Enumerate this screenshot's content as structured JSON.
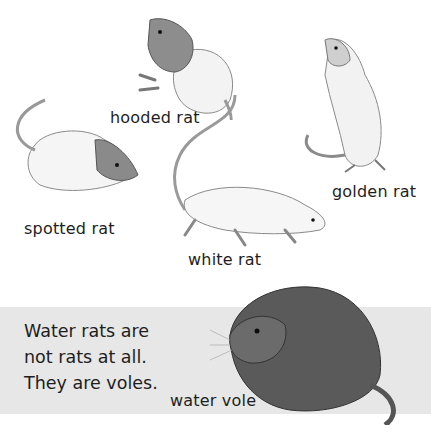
{
  "labels": {
    "hooded_rat": "hooded rat",
    "golden_rat": "golden rat",
    "spotted_rat": "spotted rat",
    "white_rat": "white rat",
    "water_vole": "water vole"
  },
  "caption": {
    "lines": [
      "Water rats are",
      "not rats at all.",
      "They are voles."
    ]
  },
  "colors": {
    "band": "#e7e7e7",
    "text": "#1e1e1e",
    "background": "#ffffff"
  }
}
